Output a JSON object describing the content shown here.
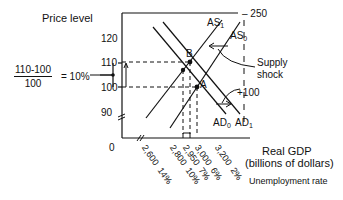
{
  "diagram": {
    "y_axis_label": "Price level",
    "y_ticks": [
      "120",
      "110",
      "100",
      "90"
    ],
    "x_origin_label": "0",
    "x_axis_label_line1": "Real GDP",
    "x_axis_label_line2": "(billions of dollars)",
    "unemployment_label": "Unemployment rate",
    "x_ticks": [
      {
        "gdp": "2,600",
        "unemp": "14%"
      },
      {
        "gdp": "2,800",
        "unemp": "10%"
      },
      {
        "gdp": "2,950",
        "unemp": "7%"
      },
      {
        "gdp": "3,000",
        "unemp": "6%"
      },
      {
        "gdp": "3,200",
        "unemp": "2%"
      }
    ],
    "inflation_calc": {
      "numerator": "110-100",
      "denominator": "100",
      "result": "= 10%"
    },
    "curves": {
      "as1": "AS",
      "as1_sub": "1",
      "as0": "AS",
      "as0_sub": "0",
      "ad0": "AD",
      "ad0_sub": "0",
      "ad1": "AD",
      "ad1_sub": "1"
    },
    "points": {
      "b": "B",
      "a": "A"
    },
    "annotations": {
      "top_value": "– 250",
      "supply_shock_line1": "Supply",
      "supply_shock_line2": "shock",
      "bottom_value": "+100"
    },
    "colors": {
      "ink": "#111111",
      "background": "#ffffff"
    }
  }
}
